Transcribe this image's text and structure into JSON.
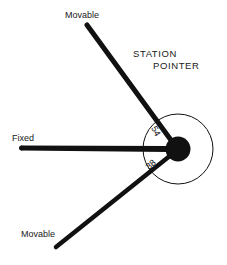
{
  "title": {
    "line1": "STATION",
    "line2": "POINTER"
  },
  "arms": {
    "upper": {
      "label": "Movable",
      "angle_label": "54"
    },
    "fixed": {
      "label": "Fixed"
    },
    "lower": {
      "label": "Movable",
      "angle_label": "38"
    }
  },
  "colors": {
    "ink": "#111111",
    "background": "#ffffff"
  }
}
